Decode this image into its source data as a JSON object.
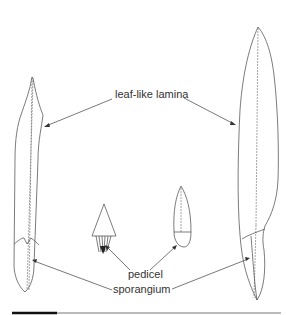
{
  "figure": {
    "type": "botanical-diagram",
    "specimens": [
      {
        "name": "narrow leaf-like sporophyll",
        "position": "left"
      },
      {
        "name": "triangular sporophyll with pedicel",
        "position": "center-left"
      },
      {
        "name": "small oval sporophyll",
        "position": "center-right"
      },
      {
        "name": "large leaf-like sporophyll",
        "position": "right"
      }
    ],
    "labels": {
      "lamina": "leaf-like lamina",
      "pedicel": "pedicel",
      "sporangium": "sporangium"
    },
    "scale_bar": {
      "visible": true
    }
  },
  "colors": {
    "line": "#444444",
    "text": "#333333",
    "background": "#ffffff"
  }
}
